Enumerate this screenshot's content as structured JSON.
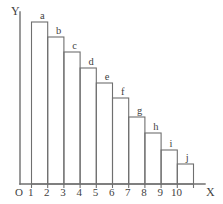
{
  "chart_data": {
    "type": "bar",
    "title": "",
    "xlabel": "X",
    "ylabel": "Y",
    "origin_label": "O",
    "categories": [
      "a",
      "b",
      "c",
      "d",
      "e",
      "f",
      "g",
      "h",
      "i",
      "j"
    ],
    "values": [
      162,
      147,
      132,
      116,
      101,
      86,
      67,
      51,
      34,
      20
    ],
    "x_tick_labels": [
      "1",
      "2",
      "3",
      "4",
      "5",
      "6",
      "7",
      "8",
      "9",
      "10"
    ],
    "x_positions": [
      1.5,
      2.5,
      3.5,
      4.5,
      5.5,
      6.5,
      7.5,
      8.5,
      9.5,
      10.5
    ],
    "xlim": [
      0.5,
      11.2
    ],
    "ylim": [
      0,
      172
    ],
    "grid": false,
    "legend": false,
    "bar_style": "outline",
    "bar_fill": "#ffffff",
    "bar_stroke": "#6f6f6f",
    "axis_color": "#6f6f6f",
    "background": "#ffffff",
    "annotations": [
      {
        "label": "a",
        "bar": 0
      },
      {
        "label": "b",
        "bar": 1
      },
      {
        "label": "c",
        "bar": 2
      },
      {
        "label": "d",
        "bar": 3
      },
      {
        "label": "e",
        "bar": 4
      },
      {
        "label": "f",
        "bar": 5
      },
      {
        "label": "g",
        "bar": 6
      },
      {
        "label": "h",
        "bar": 7
      },
      {
        "label": "i",
        "bar": 8
      },
      {
        "label": "j",
        "bar": 9
      }
    ]
  },
  "geometry": {
    "baseline_y": 184,
    "y_axis_x": 20,
    "y_axis_top": 12,
    "x_axis_right": 205,
    "unit_px": 16.2,
    "x_start_px": 31.5
  },
  "labels": {
    "y_axis": "Y",
    "x_axis": "X",
    "origin": "O",
    "ticks": [
      "1",
      "2",
      "3",
      "4",
      "5",
      "6",
      "7",
      "8",
      "9",
      "10"
    ],
    "bars": [
      "a",
      "b",
      "c",
      "d",
      "e",
      "f",
      "g",
      "h",
      "i",
      "j"
    ]
  }
}
